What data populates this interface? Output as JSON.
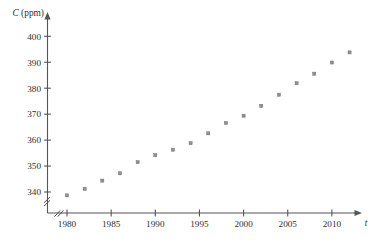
{
  "chart_data": {
    "type": "scatter",
    "title": "",
    "xlabel": "t",
    "ylabel": "C (ppm)",
    "ylabel_parts": {
      "symbol": "C",
      "units": "(ppm)"
    },
    "x": [
      1980,
      1982,
      1984,
      1986,
      1988,
      1990,
      1992,
      1994,
      1996,
      1998,
      2000,
      2002,
      2004,
      2006,
      2008,
      2010,
      2012
    ],
    "values": [
      338.7,
      341.2,
      344.4,
      347.2,
      351.5,
      354.2,
      356.3,
      358.8,
      362.6,
      366.6,
      369.4,
      373.2,
      377.5,
      381.9,
      385.6,
      389.9,
      393.8
    ],
    "xlim": [
      1978.5,
      2013.5
    ],
    "ylim": [
      336.0,
      402.0
    ],
    "xticks": [
      1980,
      1985,
      1990,
      1995,
      2000,
      2005,
      2010
    ],
    "xtick_labels": [
      "1980",
      "1985",
      "1990",
      "1995",
      "2000",
      "2005",
      "2010"
    ],
    "yticks": [
      340,
      350,
      360,
      370,
      380,
      390,
      400
    ],
    "ytick_labels": [
      "340",
      "350",
      "360",
      "370",
      "380",
      "390",
      "400"
    ],
    "grid": false,
    "legend": false,
    "axis_break_x": true,
    "axis_break_y": true,
    "marker": "square-dot",
    "marker_color": "#8f8f96",
    "axis_color": "#555558",
    "text_color": "#2e2e31"
  }
}
